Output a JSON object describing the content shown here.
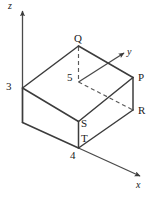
{
  "figure": {
    "stroke_color": "#3c3c3c",
    "dashed_color": "#5a5a5a",
    "axis_color": "#4a4a4a",
    "background": "#ffffff",
    "axes": [
      {
        "id": "axis-z",
        "label": "z",
        "orientation": "vertical-up"
      },
      {
        "id": "axis-y",
        "label": "y",
        "orientation": "upper-right"
      },
      {
        "id": "axis-x",
        "label": "x",
        "orientation": "lower-right"
      }
    ],
    "vertex_labels": [
      {
        "id": "label-Q",
        "text": "Q"
      },
      {
        "id": "label-P",
        "text": "P"
      },
      {
        "id": "label-R",
        "text": "R"
      },
      {
        "id": "label-S",
        "text": "S"
      },
      {
        "id": "label-T",
        "text": "T"
      }
    ],
    "measurements": [
      {
        "id": "measure-3",
        "text": "3",
        "axis": "z"
      },
      {
        "id": "measure-5",
        "text": "5",
        "axis": "y"
      },
      {
        "id": "measure-4",
        "text": "4",
        "axis": "x"
      }
    ]
  }
}
